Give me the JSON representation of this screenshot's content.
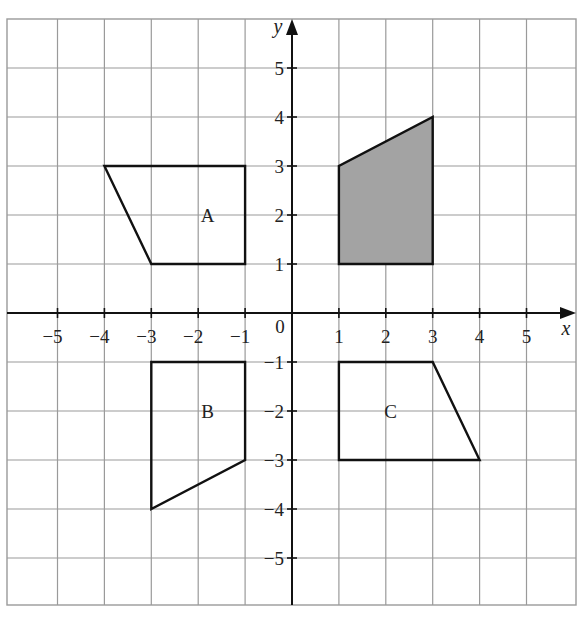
{
  "diagram": {
    "type": "coordinate-grid",
    "axes": {
      "x_label": "x",
      "y_label": "y",
      "origin_label": "0",
      "x_range": [
        -6,
        6
      ],
      "y_range": [
        -6,
        6
      ],
      "x_ticks": [
        {
          "value": -5,
          "label": "−5"
        },
        {
          "value": -4,
          "label": "−4"
        },
        {
          "value": -3,
          "label": "−3"
        },
        {
          "value": -2,
          "label": "−2"
        },
        {
          "value": -1,
          "label": "−1"
        },
        {
          "value": 1,
          "label": "1"
        },
        {
          "value": 2,
          "label": "2"
        },
        {
          "value": 3,
          "label": "3"
        },
        {
          "value": 4,
          "label": "4"
        },
        {
          "value": 5,
          "label": "5"
        }
      ],
      "y_ticks": [
        {
          "value": 5,
          "label": "5"
        },
        {
          "value": 4,
          "label": "4"
        },
        {
          "value": 3,
          "label": "3"
        },
        {
          "value": 2,
          "label": "2"
        },
        {
          "value": 1,
          "label": "1"
        },
        {
          "value": -1,
          "label": "−1"
        },
        {
          "value": -2,
          "label": "−2"
        },
        {
          "value": -3,
          "label": "−3"
        },
        {
          "value": -4,
          "label": "−4"
        },
        {
          "value": -5,
          "label": "−5"
        }
      ]
    },
    "shapes": [
      {
        "name": "shaded",
        "label": "",
        "filled": true,
        "vertices": [
          [
            1,
            1
          ],
          [
            3,
            1
          ],
          [
            3,
            4
          ],
          [
            1,
            3
          ]
        ]
      },
      {
        "name": "A",
        "label": "A",
        "filled": false,
        "vertices": [
          [
            -4,
            3
          ],
          [
            -1,
            3
          ],
          [
            -1,
            1
          ],
          [
            -3,
            1
          ]
        ],
        "label_pos": [
          -1.8,
          2
        ]
      },
      {
        "name": "B",
        "label": "B",
        "filled": false,
        "vertices": [
          [
            -3,
            -1
          ],
          [
            -1,
            -1
          ],
          [
            -1,
            -3
          ],
          [
            -3,
            -4
          ]
        ],
        "label_pos": [
          -1.8,
          -2
        ]
      },
      {
        "name": "C",
        "label": "C",
        "filled": false,
        "vertices": [
          [
            1,
            -1
          ],
          [
            3,
            -1
          ],
          [
            4,
            -3
          ],
          [
            1,
            -3
          ]
        ],
        "label_pos": [
          2.1,
          -2
        ]
      }
    ],
    "colors": {
      "grid": "#9a9a9a",
      "axis": "#111111",
      "outline": "#111111",
      "shade": "#a3a3a3",
      "background": "#ffffff"
    }
  }
}
